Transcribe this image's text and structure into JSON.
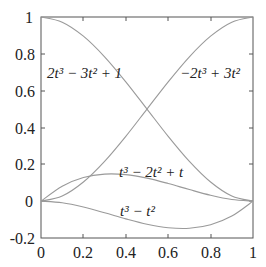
{
  "chart_data": {
    "type": "line",
    "title": "",
    "xlabel": "",
    "ylabel": "",
    "xlim": [
      0,
      1
    ],
    "ylim": [
      -0.2,
      1
    ],
    "grid": false,
    "legend": "none (inline curve labels)",
    "x_ticks": [
      "0",
      "0.2",
      "0.4",
      "0.6",
      "0.8",
      "1"
    ],
    "y_ticks": [
      "-0.2",
      "0",
      "0.2",
      "0.4",
      "0.6",
      "0.8",
      "1"
    ],
    "x": [
      0,
      0.1,
      0.2,
      0.3,
      0.4,
      0.5,
      0.6,
      0.7,
      0.8,
      0.9,
      1.0
    ],
    "series": [
      {
        "name": "2t^3 - 3t^2 + 1",
        "values": [
          1.0,
          0.972,
          0.896,
          0.784,
          0.648,
          0.5,
          0.352,
          0.216,
          0.104,
          0.028,
          0.0
        ]
      },
      {
        "name": "-2t^3 + 3t^2",
        "values": [
          0.0,
          0.028,
          0.104,
          0.216,
          0.352,
          0.5,
          0.648,
          0.784,
          0.896,
          0.972,
          1.0
        ]
      },
      {
        "name": "t^3 - 2t^2 + t",
        "values": [
          0.0,
          0.081,
          0.128,
          0.147,
          0.144,
          0.125,
          0.096,
          0.063,
          0.032,
          0.009,
          0.0
        ]
      },
      {
        "name": "t^3 - t^2",
        "values": [
          0.0,
          -0.009,
          -0.032,
          -0.063,
          -0.096,
          -0.125,
          -0.144,
          -0.147,
          -0.128,
          -0.081,
          0.0
        ]
      }
    ],
    "annotations": [
      {
        "text": "2t³ − 3t² + 1",
        "series": 0
      },
      {
        "text": "−2t³ + 3t²",
        "series": 1
      },
      {
        "text": "t³ − 2t² + t",
        "series": 2
      },
      {
        "text": "t³ − t²",
        "series": 3
      }
    ]
  },
  "labels": {
    "h00": "2t³ − 3t² + 1",
    "h01": "−2t³ + 3t²",
    "h10": "t³ − 2t² + t",
    "h11": "t³ − t²"
  },
  "colors": {
    "curve": "#9a9a9a",
    "axis": "#555555",
    "text": "#222222"
  }
}
